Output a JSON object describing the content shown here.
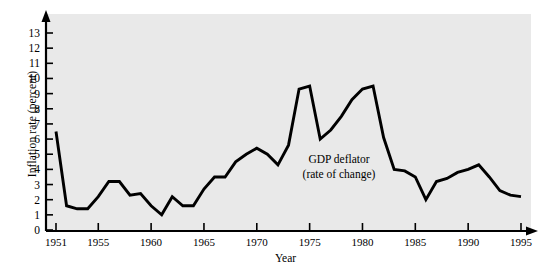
{
  "figure": {
    "background_color": "#ffffff",
    "plot_background_color": "#e9e9e9",
    "line_color": "#000000",
    "axis_color": "#000000"
  },
  "axis": {
    "y_label": "Inflation rate (percent)",
    "x_label": "Year",
    "y_ticks": [
      "0",
      "1",
      "2",
      "3",
      "4",
      "5",
      "6",
      "7",
      "8",
      "9",
      "10",
      "11",
      "12",
      "13"
    ],
    "x_ticks": [
      "1951",
      "1955",
      "1960",
      "1965",
      "1970",
      "1975",
      "1980",
      "1985",
      "1990",
      "1995"
    ]
  },
  "annotation": {
    "line1": "GDP deflator",
    "line2": "(rate of change)"
  },
  "chart_data": {
    "type": "line",
    "title": "",
    "xlabel": "Year",
    "ylabel": "Inflation rate (percent)",
    "xlim": [
      1951,
      1995
    ],
    "ylim": [
      0,
      13
    ],
    "grid": false,
    "legend": "none",
    "annotations": [
      {
        "text": "GDP deflator (rate of change)",
        "x": 1977,
        "y": 5.2
      }
    ],
    "series": [
      {
        "name": "GDP deflator (rate of change)",
        "x": [
          1951,
          1952,
          1953,
          1954,
          1955,
          1956,
          1957,
          1958,
          1959,
          1960,
          1961,
          1962,
          1963,
          1964,
          1965,
          1966,
          1967,
          1968,
          1969,
          1970,
          1971,
          1972,
          1973,
          1974,
          1975,
          1976,
          1977,
          1978,
          1979,
          1980,
          1981,
          1982,
          1983,
          1984,
          1985,
          1986,
          1987,
          1988,
          1989,
          1990,
          1991,
          1992,
          1993,
          1994,
          1995
        ],
        "values": [
          6.5,
          1.6,
          1.4,
          1.4,
          2.2,
          3.2,
          3.2,
          2.3,
          2.4,
          1.6,
          1.0,
          2.2,
          1.6,
          1.6,
          2.7,
          3.5,
          3.5,
          4.5,
          5.0,
          5.4,
          5.0,
          4.3,
          5.6,
          9.3,
          9.5,
          6.0,
          6.6,
          7.5,
          8.6,
          9.3,
          9.5,
          6.1,
          4.0,
          3.9,
          3.5,
          2.0,
          3.2,
          3.4,
          3.8,
          4.0,
          4.3,
          3.5,
          2.6,
          2.3,
          2.2
        ]
      }
    ]
  }
}
